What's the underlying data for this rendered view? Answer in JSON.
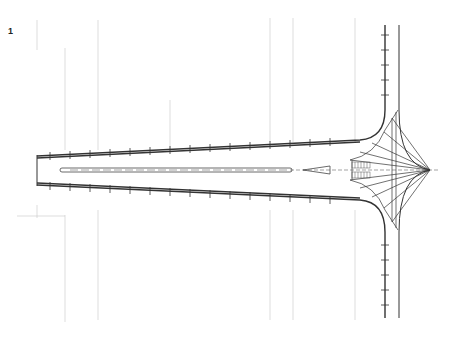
{
  "figure": {
    "number": "1",
    "type": "architectural plan drawing"
  },
  "colors": {
    "background": "#ffffff",
    "ink": "#333333",
    "faint_lines": "#bbbbbb"
  }
}
